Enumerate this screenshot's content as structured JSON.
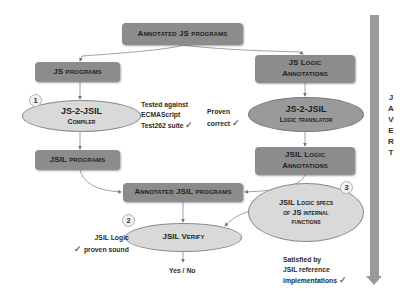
{
  "diagram": {
    "boxes": {
      "annotated_js": {
        "label": "Annotated JS programs"
      },
      "js_programs": {
        "label": "JS programs"
      },
      "js_logic_annotations": {
        "line1": "JS Logic",
        "line2": "Annotations"
      },
      "jsil_programs": {
        "label": "JSIL programs"
      },
      "jsil_logic_annotations": {
        "line1": "JSIL Logic",
        "line2": "Annotations"
      },
      "annotated_jsil": {
        "label": "Annotated JSIL programs"
      }
    },
    "ellipses": {
      "compiler": {
        "line1": "JS-2-JSIL",
        "line2": "Compiler"
      },
      "logic_translator": {
        "line1": "JS-2-JSIL",
        "line2": "Logic translator"
      },
      "specs": {
        "line1": "JSIL Logic specs",
        "line2": "of JS internal",
        "line3": "functions"
      },
      "verify": {
        "label": "JSIL Verify"
      }
    },
    "markers": {
      "one": "1",
      "two": "2",
      "three": "3"
    },
    "notes": {
      "tested": {
        "line1": "Tested against",
        "line2": "ECMAScript",
        "line3": "Test262 suite"
      },
      "proven": {
        "line1": "Proven",
        "line2": "correct"
      },
      "sound": {
        "line1": "JSIL Logic",
        "line2": "proven sound"
      },
      "satisfied": {
        "line1": "Satisfied by",
        "line2": "JSIL reference",
        "line3": "implementations"
      },
      "result": "Yes / No",
      "check_glyph": "✓"
    },
    "side_bar": {
      "letters": [
        "J",
        "A",
        "V",
        "E",
        "R",
        "T"
      ]
    },
    "colors": {
      "box": "#8c8c8c",
      "ellipse_light": "#d9d9d9",
      "ellipse_dark": "#9a9a9a",
      "bar": "#9a9a9a"
    }
  }
}
